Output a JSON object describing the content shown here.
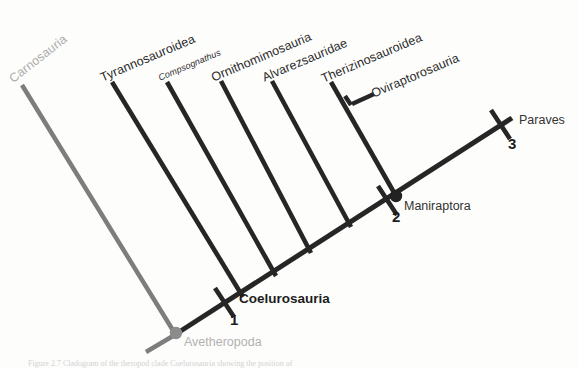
{
  "figure": {
    "type": "cladogram",
    "title_visible": false,
    "caption": "Figure 2.7 Cladogram of the theropod clade Coelurosauria showing the position of",
    "colors": {
      "branch_dark": "#262626",
      "branch_grey": "#7d7d7d",
      "label_dark": "#2b2b2b",
      "label_grey": "#b0b0b0",
      "node_grey": "#8c8c8c",
      "node_dark": "#222222",
      "background": "#fdfdfc"
    }
  },
  "tips": [
    {
      "id": "carnosauria",
      "label": "Carnosauria",
      "style": "grey",
      "rotation": -38
    },
    {
      "id": "tyrannosauroidea",
      "label": "Tyrannosauroidea",
      "style": "dark",
      "rotation": -23
    },
    {
      "id": "compsognathus",
      "label": "Compsognathus",
      "style": "dark-italic-small",
      "rotation": -23
    },
    {
      "id": "ornithomimosauria",
      "label": "Ornithomimosauria",
      "style": "dark",
      "rotation": -23
    },
    {
      "id": "alvarezsauridae",
      "label": "Alvarezsauridae",
      "style": "dark",
      "rotation": -23
    },
    {
      "id": "therizinosauroidea",
      "label": "Therizinosauroidea",
      "style": "dark",
      "rotation": -23
    },
    {
      "id": "oviraptorosauria",
      "label": "Oviraptorosauria",
      "style": "dark",
      "rotation": -23
    },
    {
      "id": "paraves",
      "label": "Paraves",
      "style": "dark-horizontal",
      "rotation": 0
    }
  ],
  "nodes": [
    {
      "id": "avetheropoda",
      "label": "Avetheropoda",
      "style": "grey",
      "marker": "circle",
      "number": null
    },
    {
      "id": "coelurosauria",
      "label": "Coelurosauria",
      "style": "bold",
      "marker": "tick",
      "number": "1"
    },
    {
      "id": "maniraptora",
      "label": "Maniraptora",
      "style": "plain",
      "marker": "circle-tick",
      "number": "2"
    },
    {
      "id": "paraves_node",
      "label": "",
      "style": "plain",
      "marker": "tick",
      "number": "3"
    }
  ],
  "markers": {
    "one": "1",
    "two": "2",
    "three": "3"
  }
}
